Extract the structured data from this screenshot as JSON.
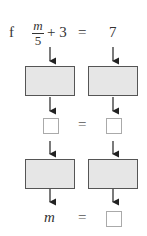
{
  "problem": {
    "label": "f",
    "equation": {
      "fraction_numerator": "m",
      "fraction_denominator": "5",
      "plus_term": "+ 3",
      "equals": "=",
      "rhs": "7"
    }
  },
  "flow": {
    "row1_boxes": [
      "",
      ""
    ],
    "middle_equals": "=",
    "row2_boxes": [
      "",
      ""
    ],
    "final_variable": "m",
    "final_equals": "="
  },
  "colors": {
    "operation_box_fill": "#e6e6e6",
    "operation_box_border": "#555555",
    "answer_box_border": "#aaaaaa"
  }
}
